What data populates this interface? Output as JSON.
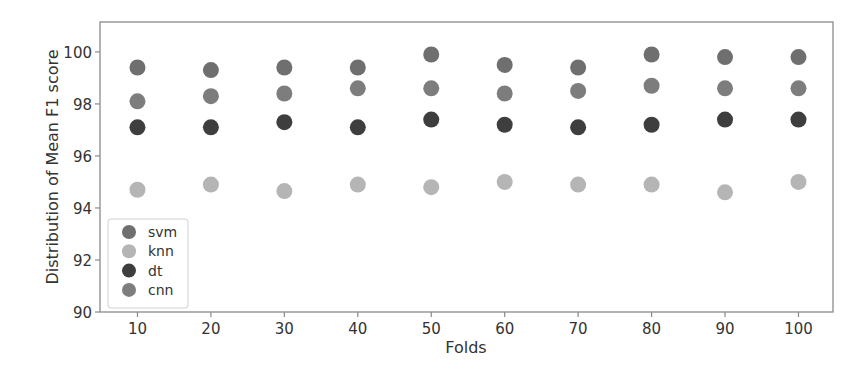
{
  "chart_data": {
    "type": "scatter",
    "title": "",
    "xlabel": "Folds",
    "ylabel": "Distribution of Mean F1 score",
    "x": [
      10,
      20,
      30,
      40,
      50,
      60,
      70,
      80,
      90,
      100
    ],
    "xticks": [
      10,
      20,
      30,
      40,
      50,
      60,
      70,
      80,
      90,
      100
    ],
    "yticks": [
      90,
      92,
      94,
      96,
      98,
      100
    ],
    "xlim": [
      4.9,
      104.7
    ],
    "ylim": [
      90,
      101.15
    ],
    "grid": false,
    "legend_position": "lower left",
    "series": [
      {
        "name": "svm",
        "color": "#6f6f6f",
        "values": [
          99.4,
          99.3,
          99.4,
          99.4,
          99.9,
          99.5,
          99.4,
          99.9,
          99.8,
          99.8
        ]
      },
      {
        "name": "knn",
        "color": "#b5b5b5",
        "values": [
          94.7,
          94.9,
          94.65,
          94.9,
          94.8,
          95.0,
          94.9,
          94.9,
          94.6,
          95.0
        ]
      },
      {
        "name": "dt",
        "color": "#3e3e3e",
        "values": [
          97.1,
          97.1,
          97.3,
          97.1,
          97.4,
          97.2,
          97.1,
          97.2,
          97.4,
          97.4
        ]
      },
      {
        "name": "cnn",
        "color": "#7d7d7d",
        "values": [
          98.1,
          98.3,
          98.4,
          98.6,
          98.6,
          98.4,
          98.5,
          98.7,
          98.6,
          98.6
        ]
      }
    ]
  },
  "plot": {
    "frame_color": "#8a8a8a",
    "text_color": "#333333"
  }
}
